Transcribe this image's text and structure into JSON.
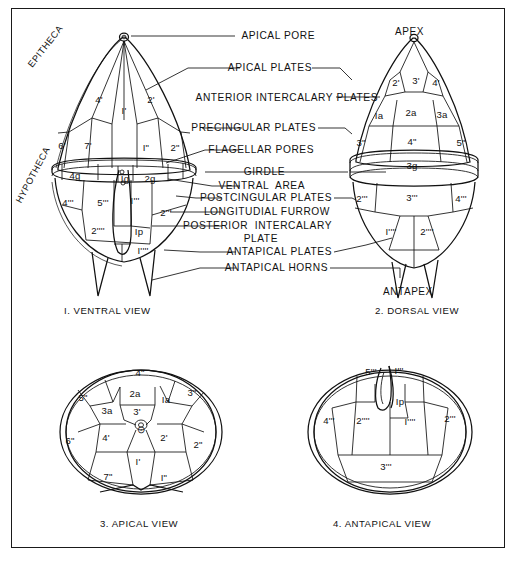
{
  "figure": {
    "background": "#ffffff",
    "ink": "#111111"
  },
  "callouts": [
    {
      "id": "apical-pore",
      "text": "APICAL PORE"
    },
    {
      "id": "apical-plates",
      "text": "APICAL PLATES"
    },
    {
      "id": "anterior-intercalary-plates",
      "text": "ANTERIOR INTERCALARY PLATES"
    },
    {
      "id": "precingular-plates",
      "text": "PRECINGULAR PLATES"
    },
    {
      "id": "flagellar-pores",
      "text": "FLAGELLAR PORES"
    },
    {
      "id": "girdle",
      "text": "GIRDLE"
    },
    {
      "id": "ventral-area",
      "text": "VENTRAL  AREA"
    },
    {
      "id": "postcingular-plates",
      "text": "POSTCINGULAR PLATES"
    },
    {
      "id": "longitudial-furrow",
      "text": "LONGITUDIAL FURROW"
    },
    {
      "id": "posterior-intercalary-plate-line1",
      "text": "POSTERIOR  INTERCALARY"
    },
    {
      "id": "posterior-intercalary-plate-line2",
      "text": "PLATE"
    },
    {
      "id": "antapical-plates",
      "text": "ANTAPICAL PLATES"
    },
    {
      "id": "antapical-horns",
      "text": "ANTAPICAL HORNS"
    }
  ],
  "orientation_labels": {
    "epitheca": "EPITHECA",
    "hypotheca": "HYPOTHECA",
    "apex": "APEX",
    "antapex": "ANTAPEX"
  },
  "views": [
    {
      "id": "ventral",
      "caption": "I. VENTRAL VIEW"
    },
    {
      "id": "dorsal",
      "caption": "2. DORSAL VIEW"
    },
    {
      "id": "apical",
      "caption": "3. APICAL VIEW"
    },
    {
      "id": "antapical",
      "caption": "4. ANTAPICAL VIEW"
    }
  ],
  "plates": {
    "ventral": [
      {
        "id": "v-4p",
        "label": "4'",
        "x": 99,
        "y": 99
      },
      {
        "id": "v-1p",
        "label": "I'",
        "x": 124,
        "y": 110
      },
      {
        "id": "v-2p",
        "label": "2'",
        "x": 151,
        "y": 99
      },
      {
        "id": "v-6p",
        "label": "6'",
        "x": 62,
        "y": 145
      },
      {
        "id": "v-7p",
        "label": "7'",
        "x": 88,
        "y": 145
      },
      {
        "id": "v-1pp",
        "label": "I\"",
        "x": 146,
        "y": 147
      },
      {
        "id": "v-2pp",
        "label": "2\"",
        "x": 175,
        "y": 147
      },
      {
        "id": "v-4g",
        "label": "4g",
        "x": 75,
        "y": 175
      },
      {
        "id": "v-1g",
        "label": "Ig",
        "x": 125,
        "y": 178
      },
      {
        "id": "v-2g",
        "label": "2g",
        "x": 150,
        "y": 178
      },
      {
        "id": "v-4ppp",
        "label": "4'''",
        "x": 68,
        "y": 202
      },
      {
        "id": "v-5ppp",
        "label": "5'''",
        "x": 103,
        "y": 202
      },
      {
        "id": "v-1ppp",
        "label": "I'''",
        "x": 135,
        "y": 200
      },
      {
        "id": "v-2ppp",
        "label": "2'''",
        "x": 166,
        "y": 212
      },
      {
        "id": "v-2pppp",
        "label": "2''''",
        "x": 98,
        "y": 230
      },
      {
        "id": "v-1p-post",
        "label": "Ip",
        "x": 139,
        "y": 231
      },
      {
        "id": "v-1pppp",
        "label": "I''''",
        "x": 143,
        "y": 250
      }
    ],
    "dorsal": [
      {
        "id": "d-2p",
        "label": "2'",
        "x": 396,
        "y": 82
      },
      {
        "id": "d-3p",
        "label": "3'",
        "x": 416,
        "y": 80
      },
      {
        "id": "d-4p",
        "label": "4'",
        "x": 436,
        "y": 82
      },
      {
        "id": "d-1a",
        "label": "Ia",
        "x": 379,
        "y": 115
      },
      {
        "id": "d-2a",
        "label": "2a",
        "x": 411,
        "y": 112
      },
      {
        "id": "d-3a",
        "label": "3a",
        "x": 442,
        "y": 114
      },
      {
        "id": "d-3pp",
        "label": "3\"",
        "x": 361,
        "y": 142
      },
      {
        "id": "d-4pp",
        "label": "4\"",
        "x": 412,
        "y": 141
      },
      {
        "id": "d-5pp",
        "label": "5\"",
        "x": 461,
        "y": 142
      },
      {
        "id": "d-3g",
        "label": "3g",
        "x": 412,
        "y": 165
      },
      {
        "id": "d-2ppp",
        "label": "2'''",
        "x": 362,
        "y": 198
      },
      {
        "id": "d-3ppp",
        "label": "3'''",
        "x": 412,
        "y": 197
      },
      {
        "id": "d-4ppp",
        "label": "4'''",
        "x": 461,
        "y": 198
      },
      {
        "id": "d-1pppp",
        "label": "I''''",
        "x": 391,
        "y": 231
      },
      {
        "id": "d-2pppp",
        "label": "2''''",
        "x": 427,
        "y": 231
      }
    ],
    "apical": [
      {
        "id": "a-4pp",
        "label": "4\"",
        "x": 140,
        "y": 372
      },
      {
        "id": "a-2a",
        "label": "2a",
        "x": 135,
        "y": 393
      },
      {
        "id": "a-1a",
        "label": "Ia",
        "x": 166,
        "y": 399
      },
      {
        "id": "a-3pp",
        "label": "3\"",
        "x": 192,
        "y": 392
      },
      {
        "id": "a-5pp",
        "label": "5\"",
        "x": 83,
        "y": 397
      },
      {
        "id": "a-3a",
        "label": "3a",
        "x": 107,
        "y": 410
      },
      {
        "id": "a-3p",
        "label": "3'",
        "x": 137,
        "y": 411
      },
      {
        "id": "a-pore",
        "label": "⊙",
        "x": 141,
        "y": 429
      },
      {
        "id": "a-6pp",
        "label": "6\"",
        "x": 70,
        "y": 440
      },
      {
        "id": "a-4p",
        "label": "4'",
        "x": 106,
        "y": 437
      },
      {
        "id": "a-2p",
        "label": "2'",
        "x": 164,
        "y": 437
      },
      {
        "id": "a-2pp",
        "label": "2\"",
        "x": 198,
        "y": 444
      },
      {
        "id": "a-1p",
        "label": "I'",
        "x": 138,
        "y": 461
      },
      {
        "id": "a-7pp",
        "label": "7\"",
        "x": 108,
        "y": 476
      },
      {
        "id": "a-1pp",
        "label": "I\"",
        "x": 164,
        "y": 477
      }
    ],
    "antapical": [
      {
        "id": "ap-5ppp",
        "label": "5'''",
        "x": 371,
        "y": 371
      },
      {
        "id": "ap-1ppp",
        "label": "I'''",
        "x": 399,
        "y": 370
      },
      {
        "id": "ap-1p-post",
        "label": "Ip",
        "x": 400,
        "y": 401
      },
      {
        "id": "ap-4ppp",
        "label": "4'''",
        "x": 329,
        "y": 420
      },
      {
        "id": "ap-2pppp",
        "label": "2''''",
        "x": 363,
        "y": 420
      },
      {
        "id": "ap-1pppp",
        "label": "I''''",
        "x": 410,
        "y": 421
      },
      {
        "id": "ap-2ppp",
        "label": "2'''",
        "x": 450,
        "y": 418
      },
      {
        "id": "ap-3ppp",
        "label": "3'''",
        "x": 386,
        "y": 466
      }
    ]
  }
}
